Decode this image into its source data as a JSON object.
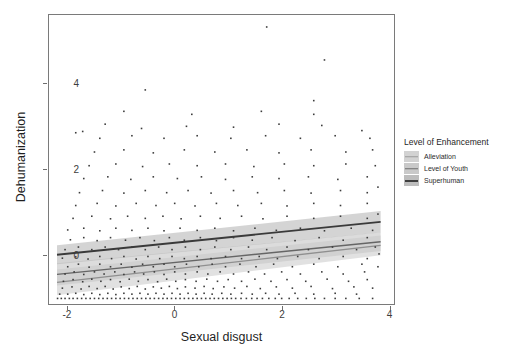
{
  "chart_data": {
    "type": "scatter",
    "title": "",
    "xlabel": "Sexual disgust",
    "ylabel": "Dehumanization",
    "xlim": [
      -2.35,
      4.1
    ],
    "ylim": [
      -1.15,
      5.6
    ],
    "xticks": [
      -2,
      0,
      2,
      4
    ],
    "xticklabels": [
      "-2",
      "0",
      "2",
      "4"
    ],
    "yticks": [
      0,
      2,
      4
    ],
    "yticklabels": [
      "0",
      "2",
      "4"
    ],
    "grid": false,
    "legend": {
      "title": "Level of Enhancement",
      "position": "right",
      "entries": [
        {
          "label": "Alleviation",
          "color": "#9a9a9a",
          "band": "#d2d2d2"
        },
        {
          "label": "Level of Youth",
          "color": "#6f6f6f",
          "band": "#c9c9c9"
        },
        {
          "label": "Superhuman",
          "color": "#3f3f3f",
          "band": "#bdbdbd"
        }
      ]
    },
    "series": [
      {
        "name": "Alleviation",
        "type": "line",
        "color": "#8f8f8f",
        "band_color": "#cfcfcf",
        "intercept": -0.33,
        "slope": 0.143,
        "x_start": -2.2,
        "x_end": 3.85,
        "y_start": -0.645,
        "y_end": 0.22,
        "ci_half_start": 0.3,
        "ci_half_end": 0.23
      },
      {
        "name": "Level of Youth",
        "type": "line",
        "color": "#666666",
        "band_color": "#c6c6c6",
        "intercept": -0.18,
        "slope": 0.126,
        "x_start": -2.2,
        "x_end": 3.85,
        "y_start": -0.457,
        "y_end": 0.305,
        "ci_half_start": 0.26,
        "ci_half_end": 0.22
      },
      {
        "name": "Superhuman",
        "type": "line",
        "color": "#3a3a3a",
        "band_color": "#b9b9b9",
        "intercept": 0.28,
        "slope": 0.127,
        "x_start": -2.2,
        "x_end": 3.85,
        "y_start": 0.0,
        "y_end": 0.77,
        "ci_half_start": 0.22,
        "ci_half_end": 0.25
      }
    ],
    "point_style": {
      "color": "#3c3c3c",
      "size": 1.6,
      "shape": "square"
    },
    "points": [
      [
        -2.19,
        -1.02
      ],
      [
        -2.12,
        -1.02
      ],
      [
        -2.05,
        -1.02
      ],
      [
        -1.97,
        -1.02
      ],
      [
        -1.9,
        -1.02
      ],
      [
        -1.82,
        -1.02
      ],
      [
        -1.74,
        -1.02
      ],
      [
        -1.66,
        -1.02
      ],
      [
        -1.58,
        -1.02
      ],
      [
        -1.5,
        -1.02
      ],
      [
        -1.42,
        -1.02
      ],
      [
        -1.34,
        -1.02
      ],
      [
        -1.26,
        -1.02
      ],
      [
        -1.18,
        -1.02
      ],
      [
        -1.1,
        -1.02
      ],
      [
        -1.02,
        -1.02
      ],
      [
        -0.94,
        -1.02
      ],
      [
        -0.86,
        -1.02
      ],
      [
        -0.78,
        -1.02
      ],
      [
        -0.7,
        -1.02
      ],
      [
        -0.62,
        -1.02
      ],
      [
        -0.54,
        -1.02
      ],
      [
        -0.46,
        -1.02
      ],
      [
        -0.38,
        -1.02
      ],
      [
        -0.3,
        -1.02
      ],
      [
        -0.22,
        -1.02
      ],
      [
        -0.14,
        -1.02
      ],
      [
        -0.06,
        -1.02
      ],
      [
        0.02,
        -1.02
      ],
      [
        0.1,
        -1.02
      ],
      [
        0.18,
        -1.02
      ],
      [
        0.26,
        -1.02
      ],
      [
        0.34,
        -1.02
      ],
      [
        0.42,
        -1.02
      ],
      [
        0.5,
        -1.02
      ],
      [
        0.58,
        -1.02
      ],
      [
        0.66,
        -1.02
      ],
      [
        0.74,
        -1.02
      ],
      [
        0.82,
        -1.02
      ],
      [
        0.9,
        -1.02
      ],
      [
        0.98,
        -1.02
      ],
      [
        1.06,
        -1.02
      ],
      [
        1.14,
        -1.02
      ],
      [
        1.24,
        -1.02
      ],
      [
        1.34,
        -1.02
      ],
      [
        1.44,
        -1.02
      ],
      [
        1.54,
        -1.02
      ],
      [
        1.64,
        -1.02
      ],
      [
        1.76,
        -1.02
      ],
      [
        1.88,
        -1.02
      ],
      [
        2.0,
        -1.02
      ],
      [
        2.14,
        -1.02
      ],
      [
        2.3,
        -1.02
      ],
      [
        2.46,
        -1.02
      ],
      [
        2.62,
        -1.02
      ],
      [
        2.8,
        -1.02
      ],
      [
        3.0,
        -1.02
      ],
      [
        3.2,
        -1.02
      ],
      [
        3.45,
        -1.02
      ],
      [
        3.7,
        -1.02
      ],
      [
        -2.15,
        -0.92
      ],
      [
        -2.0,
        -0.92
      ],
      [
        -1.85,
        -0.9
      ],
      [
        -1.7,
        -0.93
      ],
      [
        -1.55,
        -0.9
      ],
      [
        -1.4,
        -0.93
      ],
      [
        -1.25,
        -0.9
      ],
      [
        -1.1,
        -0.93
      ],
      [
        -0.95,
        -0.9
      ],
      [
        -0.8,
        -0.92
      ],
      [
        -0.65,
        -0.9
      ],
      [
        -0.5,
        -0.92
      ],
      [
        -0.35,
        -0.9
      ],
      [
        -0.2,
        -0.92
      ],
      [
        -0.05,
        -0.9
      ],
      [
        0.1,
        -0.92
      ],
      [
        0.25,
        -0.9
      ],
      [
        0.4,
        -0.92
      ],
      [
        0.55,
        -0.9
      ],
      [
        0.7,
        -0.92
      ],
      [
        0.88,
        -0.9
      ],
      [
        1.05,
        -0.92
      ],
      [
        1.25,
        -0.9
      ],
      [
        1.45,
        -0.92
      ],
      [
        1.7,
        -0.9
      ],
      [
        1.95,
        -0.92
      ],
      [
        2.25,
        -0.9
      ],
      [
        2.6,
        -0.92
      ],
      [
        3.0,
        -0.9
      ],
      [
        3.4,
        -0.92
      ],
      [
        -2.1,
        -0.78
      ],
      [
        -1.92,
        -0.75
      ],
      [
        -1.75,
        -0.8
      ],
      [
        -1.6,
        -0.74
      ],
      [
        -1.45,
        -0.79
      ],
      [
        -1.3,
        -0.74
      ],
      [
        -1.15,
        -0.8
      ],
      [
        -1.0,
        -0.75
      ],
      [
        -0.85,
        -0.79
      ],
      [
        -0.7,
        -0.74
      ],
      [
        -0.55,
        -0.8
      ],
      [
        -0.4,
        -0.75
      ],
      [
        -0.25,
        -0.78
      ],
      [
        -0.1,
        -0.74
      ],
      [
        0.05,
        -0.79
      ],
      [
        0.2,
        -0.75
      ],
      [
        0.38,
        -0.78
      ],
      [
        0.55,
        -0.74
      ],
      [
        0.72,
        -0.79
      ],
      [
        0.92,
        -0.75
      ],
      [
        1.12,
        -0.78
      ],
      [
        1.35,
        -0.74
      ],
      [
        1.6,
        -0.79
      ],
      [
        1.9,
        -0.75
      ],
      [
        2.2,
        -0.78
      ],
      [
        2.55,
        -0.74
      ],
      [
        2.95,
        -0.79
      ],
      [
        3.35,
        -0.75
      ],
      [
        3.7,
        -0.78
      ],
      [
        -2.08,
        -0.62
      ],
      [
        -1.9,
        -0.58
      ],
      [
        -1.72,
        -0.63
      ],
      [
        -1.55,
        -0.57
      ],
      [
        -1.38,
        -0.62
      ],
      [
        -1.2,
        -0.58
      ],
      [
        -1.02,
        -0.63
      ],
      [
        -0.85,
        -0.57
      ],
      [
        -0.68,
        -0.62
      ],
      [
        -0.5,
        -0.58
      ],
      [
        -0.32,
        -0.63
      ],
      [
        -0.15,
        -0.57
      ],
      [
        0.02,
        -0.62
      ],
      [
        0.2,
        -0.58
      ],
      [
        0.4,
        -0.62
      ],
      [
        0.6,
        -0.57
      ],
      [
        0.8,
        -0.62
      ],
      [
        1.0,
        -0.58
      ],
      [
        1.25,
        -0.62
      ],
      [
        1.5,
        -0.57
      ],
      [
        1.8,
        -0.62
      ],
      [
        2.1,
        -0.58
      ],
      [
        2.45,
        -0.62
      ],
      [
        2.85,
        -0.57
      ],
      [
        3.25,
        -0.62
      ],
      [
        3.6,
        -0.58
      ],
      [
        -2.05,
        -0.45
      ],
      [
        -1.88,
        -0.4
      ],
      [
        -1.7,
        -0.46
      ],
      [
        -1.5,
        -0.4
      ],
      [
        -1.32,
        -0.45
      ],
      [
        -1.12,
        -0.4
      ],
      [
        -0.95,
        -0.46
      ],
      [
        -0.75,
        -0.4
      ],
      [
        -0.58,
        -0.45
      ],
      [
        -0.38,
        -0.4
      ],
      [
        -0.2,
        -0.46
      ],
      [
        0.0,
        -0.4
      ],
      [
        0.2,
        -0.45
      ],
      [
        0.42,
        -0.4
      ],
      [
        0.62,
        -0.45
      ],
      [
        0.85,
        -0.4
      ],
      [
        1.1,
        -0.45
      ],
      [
        1.38,
        -0.4
      ],
      [
        1.68,
        -0.45
      ],
      [
        2.0,
        -0.4
      ],
      [
        2.35,
        -0.45
      ],
      [
        2.75,
        -0.4
      ],
      [
        3.15,
        -0.45
      ],
      [
        3.55,
        -0.4
      ],
      [
        -2.0,
        -0.28
      ],
      [
        -1.8,
        -0.22
      ],
      [
        -1.6,
        -0.29
      ],
      [
        -1.4,
        -0.22
      ],
      [
        -1.2,
        -0.28
      ],
      [
        -1.0,
        -0.22
      ],
      [
        -0.8,
        -0.29
      ],
      [
        -0.6,
        -0.22
      ],
      [
        -0.4,
        -0.28
      ],
      [
        -0.2,
        -0.22
      ],
      [
        0.0,
        -0.28
      ],
      [
        0.22,
        -0.22
      ],
      [
        0.45,
        -0.28
      ],
      [
        0.7,
        -0.22
      ],
      [
        0.95,
        -0.28
      ],
      [
        1.22,
        -0.22
      ],
      [
        1.52,
        -0.28
      ],
      [
        1.85,
        -0.22
      ],
      [
        2.2,
        -0.28
      ],
      [
        2.6,
        -0.22
      ],
      [
        3.05,
        -0.28
      ],
      [
        3.5,
        -0.22
      ],
      [
        3.8,
        -0.28
      ],
      [
        -2.1,
        -0.08
      ],
      [
        -1.85,
        -0.05
      ],
      [
        -1.62,
        -0.1
      ],
      [
        -1.4,
        -0.04
      ],
      [
        -1.18,
        -0.09
      ],
      [
        -0.95,
        -0.04
      ],
      [
        -0.72,
        -0.1
      ],
      [
        -0.5,
        -0.04
      ],
      [
        -0.28,
        -0.09
      ],
      [
        -0.05,
        -0.04
      ],
      [
        0.18,
        -0.09
      ],
      [
        0.42,
        -0.04
      ],
      [
        0.68,
        -0.09
      ],
      [
        0.95,
        -0.04
      ],
      [
        1.25,
        -0.09
      ],
      [
        1.58,
        -0.04
      ],
      [
        1.92,
        -0.09
      ],
      [
        2.3,
        -0.04
      ],
      [
        2.7,
        -0.09
      ],
      [
        3.15,
        -0.04
      ],
      [
        3.6,
        -0.09
      ],
      [
        3.82,
        0.02
      ],
      [
        -2.05,
        0.12
      ],
      [
        -1.8,
        0.18
      ],
      [
        -1.55,
        0.12
      ],
      [
        -1.3,
        0.18
      ],
      [
        -1.05,
        0.12
      ],
      [
        -0.8,
        0.18
      ],
      [
        -0.55,
        0.12
      ],
      [
        -0.3,
        0.18
      ],
      [
        -0.05,
        0.12
      ],
      [
        0.2,
        0.18
      ],
      [
        0.48,
        0.12
      ],
      [
        0.75,
        0.18
      ],
      [
        1.05,
        0.12
      ],
      [
        1.38,
        0.18
      ],
      [
        1.72,
        0.12
      ],
      [
        2.1,
        0.18
      ],
      [
        2.5,
        0.12
      ],
      [
        2.95,
        0.18
      ],
      [
        3.4,
        0.12
      ],
      [
        3.75,
        0.18
      ],
      [
        -1.95,
        0.35
      ],
      [
        -1.7,
        0.4
      ],
      [
        -1.45,
        0.33
      ],
      [
        -1.2,
        0.4
      ],
      [
        -0.92,
        0.34
      ],
      [
        -0.65,
        0.4
      ],
      [
        -0.38,
        0.33
      ],
      [
        -0.1,
        0.4
      ],
      [
        0.18,
        0.34
      ],
      [
        0.48,
        0.4
      ],
      [
        0.78,
        0.33
      ],
      [
        1.1,
        0.4
      ],
      [
        1.45,
        0.34
      ],
      [
        1.82,
        0.4
      ],
      [
        2.25,
        0.33
      ],
      [
        2.7,
        0.4
      ],
      [
        3.15,
        0.34
      ],
      [
        3.6,
        0.4
      ],
      [
        -2.0,
        0.58
      ],
      [
        -1.7,
        0.62
      ],
      [
        -1.4,
        0.56
      ],
      [
        -1.1,
        0.62
      ],
      [
        -0.8,
        0.57
      ],
      [
        -0.5,
        0.62
      ],
      [
        -0.2,
        0.56
      ],
      [
        0.1,
        0.62
      ],
      [
        0.42,
        0.57
      ],
      [
        0.75,
        0.62
      ],
      [
        1.1,
        0.56
      ],
      [
        1.5,
        0.62
      ],
      [
        1.9,
        0.57
      ],
      [
        2.35,
        0.62
      ],
      [
        2.8,
        0.56
      ],
      [
        3.3,
        0.62
      ],
      [
        3.7,
        0.57
      ],
      [
        -1.9,
        0.85
      ],
      [
        -1.55,
        0.9
      ],
      [
        -1.2,
        0.84
      ],
      [
        -0.88,
        0.9
      ],
      [
        -0.55,
        0.85
      ],
      [
        -0.22,
        0.9
      ],
      [
        0.12,
        0.84
      ],
      [
        0.48,
        0.9
      ],
      [
        0.85,
        0.85
      ],
      [
        1.25,
        0.9
      ],
      [
        1.65,
        0.84
      ],
      [
        2.1,
        0.9
      ],
      [
        2.6,
        0.85
      ],
      [
        3.1,
        0.9
      ],
      [
        3.6,
        0.85
      ],
      [
        3.8,
        0.95
      ],
      [
        -1.85,
        1.15
      ],
      [
        -1.45,
        1.2
      ],
      [
        -1.1,
        1.14
      ],
      [
        -0.72,
        1.2
      ],
      [
        -0.35,
        1.15
      ],
      [
        0.0,
        1.2
      ],
      [
        0.38,
        1.14
      ],
      [
        0.78,
        1.2
      ],
      [
        1.18,
        1.15
      ],
      [
        1.62,
        1.2
      ],
      [
        2.1,
        1.14
      ],
      [
        2.6,
        1.2
      ],
      [
        3.1,
        1.15
      ],
      [
        3.6,
        1.2
      ],
      [
        -1.78,
        1.45
      ],
      [
        -1.35,
        1.5
      ],
      [
        -0.95,
        1.44
      ],
      [
        -0.55,
        1.5
      ],
      [
        -0.15,
        1.45
      ],
      [
        0.25,
        1.5
      ],
      [
        0.68,
        1.44
      ],
      [
        1.1,
        1.5
      ],
      [
        1.55,
        1.45
      ],
      [
        2.05,
        1.5
      ],
      [
        2.55,
        1.44
      ],
      [
        3.1,
        1.5
      ],
      [
        3.6,
        1.45
      ],
      [
        3.8,
        1.58
      ],
      [
        -1.7,
        1.78
      ],
      [
        -1.25,
        1.82
      ],
      [
        -0.82,
        1.76
      ],
      [
        -0.4,
        1.82
      ],
      [
        0.05,
        1.78
      ],
      [
        0.5,
        1.82
      ],
      [
        0.95,
        1.76
      ],
      [
        1.45,
        1.82
      ],
      [
        1.95,
        1.78
      ],
      [
        2.5,
        1.82
      ],
      [
        3.05,
        1.76
      ],
      [
        3.6,
        1.82
      ],
      [
        -1.6,
        2.08
      ],
      [
        -1.1,
        2.12
      ],
      [
        -0.6,
        2.06
      ],
      [
        -0.1,
        2.12
      ],
      [
        0.42,
        2.08
      ],
      [
        0.95,
        2.12
      ],
      [
        1.48,
        2.06
      ],
      [
        2.05,
        2.12
      ],
      [
        2.6,
        2.08
      ],
      [
        3.2,
        2.12
      ],
      [
        3.75,
        2.08
      ],
      [
        -1.5,
        2.4
      ],
      [
        -0.95,
        2.45
      ],
      [
        -0.4,
        2.38
      ],
      [
        0.18,
        2.45
      ],
      [
        0.75,
        2.4
      ],
      [
        1.35,
        2.45
      ],
      [
        1.95,
        2.38
      ],
      [
        2.55,
        2.45
      ],
      [
        3.2,
        2.4
      ],
      [
        3.7,
        2.45
      ],
      [
        -1.4,
        2.72
      ],
      [
        -0.8,
        2.78
      ],
      [
        -0.2,
        2.72
      ],
      [
        0.42,
        2.78
      ],
      [
        1.05,
        2.72
      ],
      [
        1.7,
        2.78
      ],
      [
        2.35,
        2.72
      ],
      [
        3.0,
        2.78
      ],
      [
        3.65,
        2.72
      ],
      [
        -1.85,
        2.85
      ],
      [
        -1.72,
        2.88
      ],
      [
        -1.3,
        3.05
      ],
      [
        -0.62,
        2.95
      ],
      [
        0.22,
        3.0
      ],
      [
        1.1,
        2.98
      ],
      [
        1.95,
        3.05
      ],
      [
        2.75,
        3.02
      ],
      [
        3.5,
        2.9
      ],
      [
        -0.95,
        3.35
      ],
      [
        0.32,
        3.28
      ],
      [
        1.62,
        3.35
      ],
      [
        2.6,
        3.28
      ],
      [
        -0.55,
        3.85
      ],
      [
        2.6,
        3.6
      ],
      [
        2.8,
        4.55
      ],
      [
        1.72,
        5.32
      ]
    ]
  }
}
